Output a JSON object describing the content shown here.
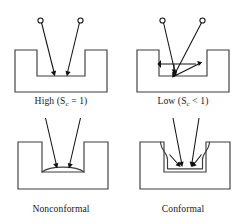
{
  "figure": {
    "kind": "deposition-step-coverage-diagram",
    "background_color": "#ffffff",
    "line_color": "#3d3d3d",
    "ray_color": "#111111",
    "panels": [
      {
        "id": "top-left",
        "caption_prefix": "High (S",
        "caption_subscript": "c",
        "caption_suffix": " = 1)",
        "caption_plain": "High (S_c = 1)",
        "sticking_coefficient": "1",
        "regime": "High",
        "description": "Two incident flux rays from point sources travel directly to the trench bottom with no re-emission.",
        "source_count": 2,
        "arrow_count": 2,
        "trench": "deep"
      },
      {
        "id": "top-right",
        "caption_prefix": "Low (S",
        "caption_subscript": "c",
        "caption_suffix": " < 1)",
        "caption_plain": "Low (S_c < 1)",
        "sticking_coefficient": "< 1",
        "regime": "Low",
        "description": "Incident rays reach the trench bottom, re-emit and scatter toward the sidewalls, giving multiple surface reflections.",
        "source_count": 2,
        "arrow_count": 5,
        "trench": "deep"
      },
      {
        "id": "bottom-left",
        "caption_prefix": "Nonconformal",
        "caption_subscript": "",
        "caption_suffix": "",
        "caption_plain": "Nonconformal",
        "description": "Film accumulates as a thick lens-shaped mound only on the trench floor; sidewalls stay bare.",
        "arrow_count": 2,
        "film_profile": "lens-shaped bottom deposit",
        "trench": "shallow"
      },
      {
        "id": "bottom-right",
        "caption_prefix": "Conformal",
        "caption_subscript": "",
        "caption_suffix": "",
        "caption_plain": "Conformal",
        "description": "Film of uniform thickness lines the trench floor and both sidewalls, following the original contour.",
        "arrow_count": 4,
        "film_profile": "uniform conformal liner",
        "trench": "shallow"
      }
    ]
  }
}
